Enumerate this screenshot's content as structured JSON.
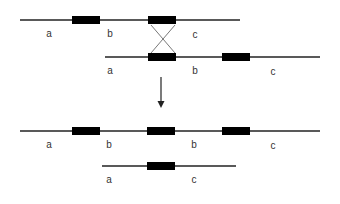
{
  "diagram": {
    "type": "unequal-crossing-over",
    "colors": {
      "line": "#222222",
      "box": "#000000",
      "cross": "#555555",
      "label": "#333333"
    },
    "before": {
      "strand_top": {
        "line": [
          20,
          240
        ],
        "y": 20,
        "boxes": [
          [
            72,
            100
          ],
          [
            148,
            176
          ]
        ],
        "labels": [
          {
            "text": "a",
            "x": 49,
            "y": 29
          },
          {
            "text": "b",
            "x": 110,
            "y": 29
          },
          {
            "text": "c",
            "x": 195,
            "y": 30
          }
        ]
      },
      "strand_bottom": {
        "line": [
          105,
          320
        ],
        "y": 57,
        "boxes": [
          [
            148,
            176
          ],
          [
            222,
            250
          ]
        ],
        "labels": [
          {
            "text": "a",
            "x": 110,
            "y": 66
          },
          {
            "text": "b",
            "x": 195,
            "y": 66
          },
          {
            "text": "c",
            "x": 273,
            "y": 67
          }
        ]
      },
      "crossover": {
        "x1": 151,
        "x2": 175,
        "y_top": 25,
        "y_bottom": 53
      }
    },
    "arrow": {
      "x": 161,
      "y_start": 77,
      "y_end": 108
    },
    "after": {
      "strand_long": {
        "line": [
          20,
          320
        ],
        "y": 131,
        "boxes": [
          [
            72,
            100
          ],
          [
            147,
            175
          ],
          [
            222,
            250
          ]
        ],
        "labels": [
          {
            "text": "a",
            "x": 49,
            "y": 140
          },
          {
            "text": "b",
            "x": 109,
            "y": 140
          },
          {
            "text": "b",
            "x": 194,
            "y": 140
          },
          {
            "text": "c",
            "x": 273,
            "y": 141
          }
        ]
      },
      "strand_short": {
        "line": [
          102,
          236
        ],
        "y": 166,
        "boxes": [
          [
            147,
            175
          ]
        ],
        "labels": [
          {
            "text": "a",
            "x": 109,
            "y": 175
          },
          {
            "text": "c",
            "x": 194,
            "y": 175
          }
        ]
      }
    }
  }
}
